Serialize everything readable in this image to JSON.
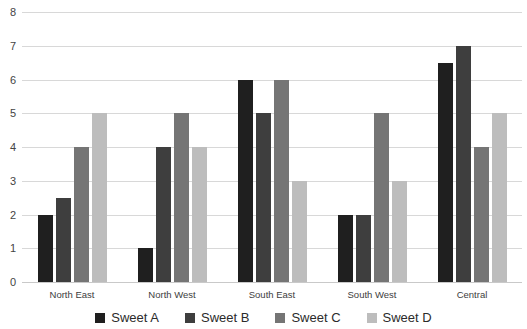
{
  "chart_data": {
    "type": "bar",
    "title": "",
    "xlabel": "",
    "ylabel": "",
    "ylim": [
      0,
      8
    ],
    "ytick_step": 1,
    "yticks": [
      "0",
      "1",
      "2",
      "3",
      "4",
      "5",
      "6",
      "7",
      "8"
    ],
    "grid": true,
    "legend_position": "bottom",
    "grouping": "grouped",
    "categories": [
      "North East",
      "North West",
      "South East",
      "South West",
      "Central"
    ],
    "series": [
      {
        "name": "Sweet A",
        "color": "#1f1f1f",
        "values": [
          2,
          1,
          6,
          2,
          6.5
        ]
      },
      {
        "name": "Sweet B",
        "color": "#3e3e3e",
        "values": [
          2.5,
          4,
          5,
          2,
          7
        ]
      },
      {
        "name": "Sweet C",
        "color": "#757575",
        "values": [
          4,
          5,
          6,
          5,
          4
        ]
      },
      {
        "name": "Sweet D",
        "color": "#bdbdbd",
        "values": [
          5,
          4,
          3,
          3,
          5
        ]
      }
    ]
  },
  "colors": {
    "gridline": "#d8d8d8",
    "axis_text": "#444444",
    "background": "#ffffff"
  }
}
